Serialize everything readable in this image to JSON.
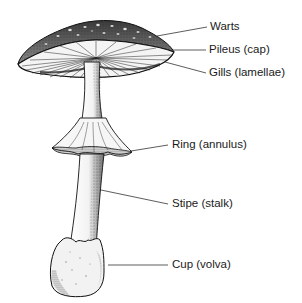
{
  "diagram": {
    "colors": {
      "ink": "#1a1a1a",
      "background": "#ffffff",
      "leader": "#333333"
    },
    "labels": [
      {
        "id": "warts",
        "text": "Warts",
        "x": 210,
        "y": 21,
        "line": [
          157,
          36,
          207,
          27
        ]
      },
      {
        "id": "pileus",
        "text": "Pileus (cap)",
        "x": 209,
        "y": 44,
        "line": [
          172,
          50,
          206,
          50
        ]
      },
      {
        "id": "gills",
        "text": "Gills (lamellae)",
        "x": 209,
        "y": 67,
        "line": [
          165,
          62,
          206,
          73
        ]
      },
      {
        "id": "ring",
        "text": "Ring (annulus)",
        "x": 172,
        "y": 139,
        "line": [
          131,
          151,
          168,
          145
        ]
      },
      {
        "id": "stipe",
        "text": "Stipe (stalk)",
        "x": 172,
        "y": 198,
        "line": [
          101,
          190,
          168,
          204
        ]
      },
      {
        "id": "cup",
        "text": "Cup (volva)",
        "x": 172,
        "y": 259,
        "line": [
          108,
          265,
          168,
          265
        ]
      }
    ]
  }
}
